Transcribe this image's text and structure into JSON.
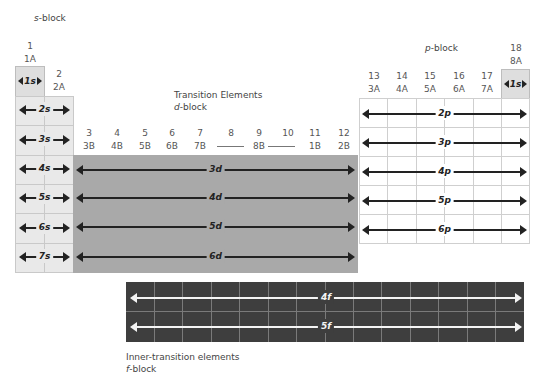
{
  "blocks": {
    "s": {
      "label_prefix": "s",
      "label_suffix": "-block"
    },
    "d": {
      "heading": "Transition Elements",
      "label_prefix": "d",
      "label_suffix": "-block"
    },
    "p": {
      "label_prefix": "p",
      "label_suffix": "-block"
    },
    "f": {
      "heading": "Inner-transition elements",
      "label_prefix": "f",
      "label_suffix": "-block"
    }
  },
  "groups": {
    "g1": {
      "num": "1",
      "old": "1A"
    },
    "g2": {
      "num": "2",
      "old": "2A"
    },
    "d": [
      {
        "num": "3",
        "old": "3B"
      },
      {
        "num": "4",
        "old": "4B"
      },
      {
        "num": "5",
        "old": "5B"
      },
      {
        "num": "6",
        "old": "6B"
      },
      {
        "num": "7",
        "old": "7B"
      },
      {
        "num": "8",
        "old": ""
      },
      {
        "num": "9",
        "old": "8B"
      },
      {
        "num": "10",
        "old": ""
      },
      {
        "num": "11",
        "old": "1B"
      },
      {
        "num": "12",
        "old": "2B"
      }
    ],
    "p": [
      {
        "num": "13",
        "old": "3A"
      },
      {
        "num": "14",
        "old": "4A"
      },
      {
        "num": "15",
        "old": "5A"
      },
      {
        "num": "16",
        "old": "6A"
      },
      {
        "num": "17",
        "old": "7A"
      }
    ],
    "g18": {
      "num": "18",
      "old": "8A"
    }
  },
  "orbitals": {
    "s": [
      {
        "n": "1",
        "l": "s"
      },
      {
        "n": "2",
        "l": "s"
      },
      {
        "n": "3",
        "l": "s"
      },
      {
        "n": "4",
        "l": "s"
      },
      {
        "n": "5",
        "l": "s"
      },
      {
        "n": "6",
        "l": "s"
      },
      {
        "n": "7",
        "l": "s"
      }
    ],
    "he_1s": {
      "n": "1",
      "l": "s"
    },
    "p": [
      {
        "n": "2",
        "l": "p"
      },
      {
        "n": "3",
        "l": "p"
      },
      {
        "n": "4",
        "l": "p"
      },
      {
        "n": "5",
        "l": "p"
      },
      {
        "n": "6",
        "l": "p"
      }
    ],
    "d": [
      {
        "n": "3",
        "l": "d"
      },
      {
        "n": "4",
        "l": "d"
      },
      {
        "n": "5",
        "l": "d"
      },
      {
        "n": "6",
        "l": "d"
      }
    ],
    "f": [
      {
        "n": "4",
        "l": "f"
      },
      {
        "n": "5",
        "l": "f"
      }
    ]
  },
  "colors": {
    "s_block": "#e9e9e9",
    "d_block": "#a9a9a9",
    "p_block": "#ffffff",
    "f_block": "#3e3e3e"
  }
}
